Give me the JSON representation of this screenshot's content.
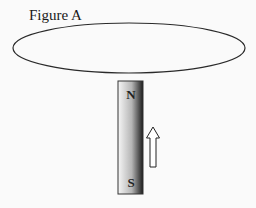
{
  "figure": {
    "title": "Figure A"
  },
  "loop": {
    "shape": "ellipse",
    "stroke_color": "#2a2a2a"
  },
  "magnet": {
    "north_label": "N",
    "south_label": "S",
    "gradient_colors": [
      "#f4f4f4",
      "#b8b8b8",
      "#1e1e1e"
    ],
    "border_color": "#333333"
  },
  "motion_arrow": {
    "direction": "up",
    "icon": "hollow-arrow-up-icon",
    "stroke_color": "#222222"
  }
}
